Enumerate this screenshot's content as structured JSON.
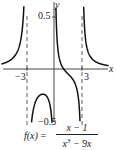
{
  "chart_data": {
    "type": "line",
    "title": "",
    "function": "f(x) = (x - 1) / (x^3 - 9x)",
    "xlabel": "x",
    "ylabel": "y",
    "xlim": [
      -5.8,
      6.0
    ],
    "ylim": [
      -0.55,
      0.55
    ],
    "x_ticks": [
      {
        "value": -3,
        "label": "-3"
      },
      {
        "value": 3,
        "label": "3"
      }
    ],
    "y_ticks": [
      {
        "value": 0.5,
        "label": "0.5"
      },
      {
        "value": -0.5,
        "label": "-0.5"
      }
    ],
    "vertical_asymptotes": [
      -3,
      0,
      3
    ],
    "grid": false,
    "series": [
      {
        "name": "f(x) left branch",
        "x": [
          -5.8,
          -5,
          -4.5,
          -4,
          -3.5,
          -3.2
        ],
        "y": [
          0.041,
          0.075,
          0.11,
          0.179,
          0.417,
          1.2
        ]
      },
      {
        "name": "f(x) middle-left branch",
        "x": [
          -2.85,
          -2.5,
          -2,
          -1.5,
          -1,
          -0.5,
          -0.3
        ],
        "y": [
          -0.5,
          -0.51,
          -0.3,
          -0.247,
          -0.25,
          -0.34,
          -0.49
        ]
      },
      {
        "name": "f(x) middle-right branch",
        "x": [
          0.2,
          0.5,
          1,
          1.5,
          2,
          2.5,
          2.9
        ],
        "y": [
          0.45,
          0.227,
          0,
          -0.049,
          -0.05,
          -0.15,
          -0.5
        ]
      },
      {
        "name": "f(x) right branch",
        "x": [
          3.2,
          3.5,
          4,
          4.5,
          5,
          6
        ],
        "y": [
          0.4,
          0.179,
          0.107,
          0.078,
          0.05,
          0.03
        ]
      }
    ]
  },
  "labels": {
    "x_axis": "x",
    "y_axis": "y",
    "tick_neg3": "−3",
    "tick_3": "3",
    "tick_pos_half": "0.5",
    "tick_neg_half": "−0.5"
  },
  "formula": {
    "lhs": "f(x)",
    "eq": " =",
    "numerator": "x − 1",
    "den_a": "x",
    "den_exp": "3",
    "den_b": " − 9x"
  }
}
